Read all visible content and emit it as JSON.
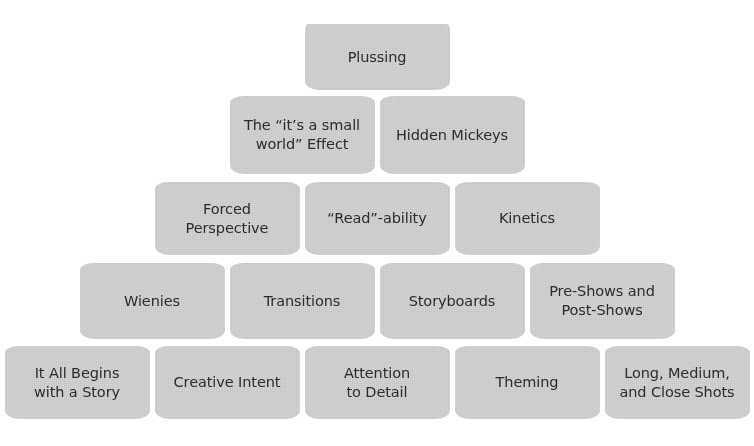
{
  "diagram": {
    "type": "pyramid",
    "title": "",
    "block_color": "#c6c6c6",
    "text_color": "#2b2b2b",
    "background_color": "#ffffff",
    "row_count": 5,
    "rows": [
      {
        "level": 1,
        "blocks": [
          {
            "label": "Plussing"
          }
        ]
      },
      {
        "level": 2,
        "blocks": [
          {
            "label": "The “it’s a small\nworld” Effect"
          },
          {
            "label": "Hidden Mickeys"
          }
        ]
      },
      {
        "level": 3,
        "blocks": [
          {
            "label": "Forced\nPerspective"
          },
          {
            "label": "“Read”-ability"
          },
          {
            "label": "Kinetics"
          }
        ]
      },
      {
        "level": 4,
        "blocks": [
          {
            "label": "Wienies"
          },
          {
            "label": "Transitions"
          },
          {
            "label": "Storyboards"
          },
          {
            "label": "Pre-Shows and\nPost-Shows"
          }
        ]
      },
      {
        "level": 5,
        "blocks": [
          {
            "label": "It All Begins\nwith a Story"
          },
          {
            "label": "Creative Intent"
          },
          {
            "label": "Attention\nto Detail"
          },
          {
            "label": "Theming"
          },
          {
            "label": "Long, Medium,\nand Close Shots"
          }
        ]
      }
    ]
  }
}
